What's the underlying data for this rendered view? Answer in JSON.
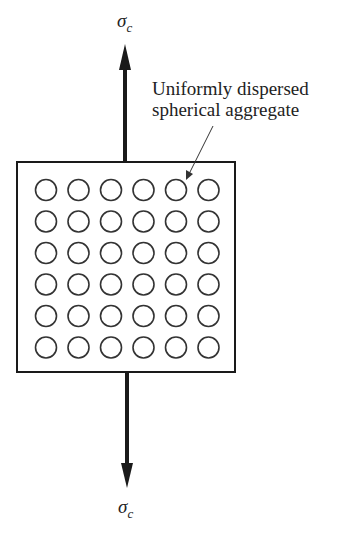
{
  "diagram": {
    "top_label": {
      "symbol": "σ",
      "subscript": "c"
    },
    "bottom_label": {
      "symbol": "σ",
      "subscript": "c"
    },
    "annotation": {
      "line1": "Uniformly dispersed",
      "line2": "spherical aggregate"
    },
    "grid": {
      "rows": 6,
      "cols": 6
    },
    "colors": {
      "stroke": "#1a1a1a",
      "circle": "#333333"
    }
  }
}
